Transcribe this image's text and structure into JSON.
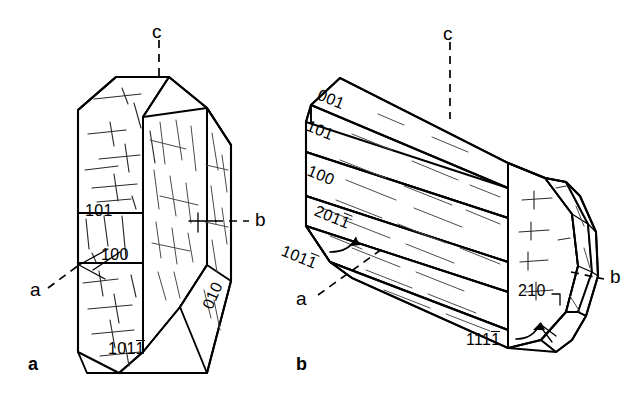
{
  "figure": {
    "type": "crystal-habit-line-drawing",
    "background_color": "#ffffff",
    "line_color": "#000000",
    "panels": [
      {
        "caption": "a",
        "description": "Prismatic crystal with 101, 100, 010 and 101-bar faces",
        "axes": [
          {
            "name": "c",
            "label": "c"
          },
          {
            "name": "b",
            "label": "b"
          },
          {
            "name": "a",
            "label": "a"
          }
        ],
        "face_labels": [
          {
            "id": "left-101",
            "text": "101",
            "overbar": false
          },
          {
            "id": "front-100",
            "text": "100",
            "overbar": false
          },
          {
            "id": "right-010",
            "text": "010",
            "overbar": false,
            "rotated": true
          },
          {
            "id": "lower-101bar",
            "text": "101",
            "overbar": true
          }
        ]
      },
      {
        "caption": "b",
        "description": "Elongated prismatic crystal with complex terminal facets",
        "axes": [
          {
            "name": "c",
            "label": "c"
          },
          {
            "name": "b",
            "label": "b"
          },
          {
            "name": "a",
            "label": "a"
          }
        ],
        "face_labels": [
          {
            "id": "f-001",
            "text": "001",
            "overbar": false
          },
          {
            "id": "f-101",
            "text": "101",
            "overbar": false
          },
          {
            "id": "f-100",
            "text": "100",
            "overbar": false
          },
          {
            "id": "f-201bar",
            "text": "201",
            "overbar": true
          },
          {
            "id": "f-101bar",
            "text": "101",
            "overbar": true
          },
          {
            "id": "f-210",
            "text": "210",
            "overbar": false
          },
          {
            "id": "f-111bar",
            "text": "111",
            "overbar": true
          }
        ]
      }
    ]
  },
  "labels": {
    "panel_a": {
      "axis_c": "c",
      "axis_b": "b",
      "axis_a": "a",
      "face_101": "101",
      "face_100": "100",
      "face_010": "010",
      "face_101bar_digits": "101",
      "caption": "a"
    },
    "panel_b": {
      "axis_c": "c",
      "axis_b": "b",
      "axis_a": "a",
      "face_001": "001",
      "face_101": "101",
      "face_100": "100",
      "face_201bar_digits": "201",
      "face_101bar_digits": "101",
      "face_210": "210",
      "face_111bar_digits": "111",
      "caption": "b"
    }
  }
}
